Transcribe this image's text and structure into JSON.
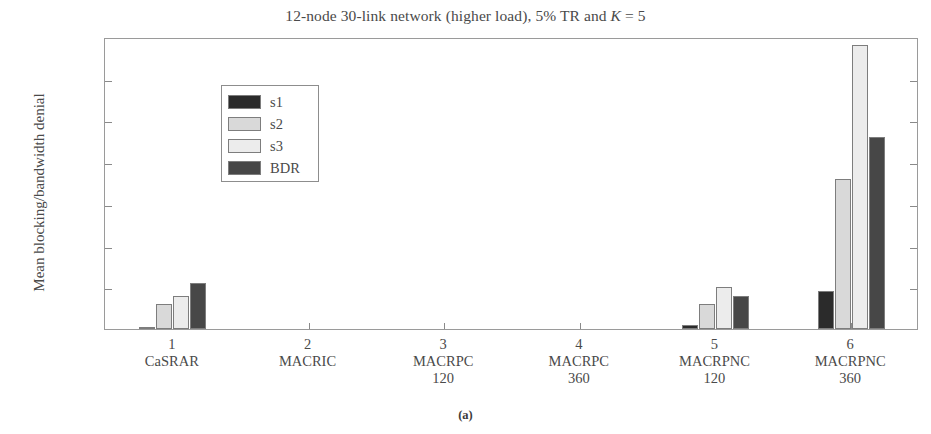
{
  "figure": {
    "caption": "(a)"
  },
  "chart_data": {
    "type": "bar",
    "title": "12-node 30-link network (higher load), 5% TR and K = 5",
    "title_parts": {
      "before_italic": "12-node 30-link network (higher load), 5% TR and ",
      "italic": "K",
      "after_italic": " = 5"
    },
    "xlabel": "",
    "ylabel": "Mean blocking/bandwidth denial",
    "ylim": [
      0,
      0.035
    ],
    "yticks": [
      0,
      0.005,
      0.01,
      0.015,
      0.02,
      0.025,
      0.03,
      0.035
    ],
    "ytick_labels": [
      "0",
      "0.005",
      "0.01",
      "0.015",
      "0.02",
      "0.025",
      "0.03",
      "0.035"
    ],
    "xticks": [
      1,
      2,
      3,
      4,
      5,
      6
    ],
    "grid": false,
    "legend_position": "upper left",
    "categories": [
      {
        "index": "1",
        "name": "CaSRAR",
        "sub": ""
      },
      {
        "index": "2",
        "name": "MACRIC",
        "sub": ""
      },
      {
        "index": "3",
        "name": "MACRPC",
        "sub": "120"
      },
      {
        "index": "4",
        "name": "MACRPC",
        "sub": "360"
      },
      {
        "index": "5",
        "name": "MACRPNC",
        "sub": "120"
      },
      {
        "index": "6",
        "name": "MACRPNC",
        "sub": "360"
      }
    ],
    "series": [
      {
        "name": "s1",
        "color": "#2b2b2b",
        "values": [
          0.0002,
          0,
          0,
          0,
          0.0005,
          0.0045
        ]
      },
      {
        "name": "s2",
        "color": "#d9d9d9",
        "values": [
          0.003,
          0,
          0,
          0,
          0.003,
          0.018
        ]
      },
      {
        "name": "s3",
        "color": "#ececec",
        "values": [
          0.004,
          0,
          0,
          0,
          0.005,
          0.034
        ]
      },
      {
        "name": "BDR",
        "color": "#474747",
        "values": [
          0.0055,
          0,
          0,
          0,
          0.004,
          0.023
        ]
      }
    ]
  }
}
